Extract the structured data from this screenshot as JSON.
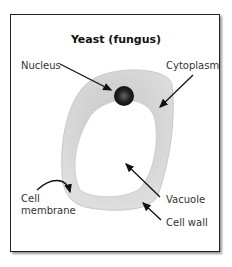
{
  "title": "Yeast (fungus)",
  "labels": {
    "nucleus": "Nucleus",
    "cytoplasm": "Cytoplasm",
    "cell_membrane_line1": "Cell",
    "cell_membrane_line2": "membrane",
    "vacuole": "Vacuole",
    "cell_wall": "Cell wall"
  },
  "colors": {
    "cytoplasm": "#d0d0d0",
    "nucleus": "#222222",
    "outline": "#222222"
  }
}
